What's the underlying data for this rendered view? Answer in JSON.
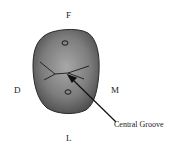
{
  "diagram": {
    "labels": {
      "top": "F",
      "left": "D",
      "right": "M",
      "bottom": "L",
      "callout": "Central Groove"
    },
    "colors": {
      "tooth_fill": "#6e6e6e",
      "tooth_light": "#9a9a9a",
      "outline": "#2a2a2a",
      "text": "#222222"
    }
  }
}
